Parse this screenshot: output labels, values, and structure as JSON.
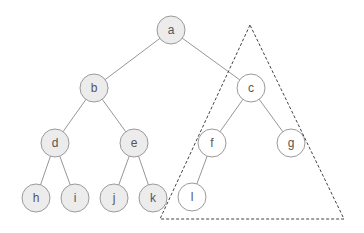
{
  "diagram": {
    "type": "binary-tree",
    "colors": {
      "filled_node": "#ececec",
      "empty_node": "#ffffff",
      "node_stroke": "#9a9a9a",
      "edge": "#8a8a8a",
      "label": "#555555",
      "outline": "#444444"
    },
    "node_radius": 14,
    "nodes": [
      {
        "id": "a",
        "label": "a",
        "x": 171,
        "y": 30,
        "filled": true
      },
      {
        "id": "b",
        "label": "b",
        "x": 94,
        "y": 88,
        "filled": true
      },
      {
        "id": "c",
        "label": "c",
        "x": 251,
        "y": 88,
        "filled": false
      },
      {
        "id": "d",
        "label": "d",
        "x": 55,
        "y": 143,
        "filled": true
      },
      {
        "id": "e",
        "label": "e",
        "x": 134,
        "y": 143,
        "filled": true
      },
      {
        "id": "f",
        "label": "f",
        "x": 212,
        "y": 143,
        "filled": false
      },
      {
        "id": "g",
        "label": "g",
        "x": 291,
        "y": 143,
        "filled": false
      },
      {
        "id": "h",
        "label": "h",
        "x": 36,
        "y": 198,
        "filled": true
      },
      {
        "id": "i",
        "label": "i",
        "x": 75,
        "y": 198,
        "filled": true
      },
      {
        "id": "j",
        "label": "j",
        "x": 114,
        "y": 198,
        "filled": true
      },
      {
        "id": "k",
        "label": "k",
        "x": 153,
        "y": 198,
        "filled": true
      },
      {
        "id": "l",
        "label": "l",
        "x": 192,
        "y": 197,
        "filled": false
      }
    ],
    "edges": [
      [
        "a",
        "b"
      ],
      [
        "a",
        "c"
      ],
      [
        "b",
        "d"
      ],
      [
        "b",
        "e"
      ],
      [
        "c",
        "f"
      ],
      [
        "c",
        "g"
      ],
      [
        "d",
        "h"
      ],
      [
        "d",
        "i"
      ],
      [
        "e",
        "j"
      ],
      [
        "e",
        "k"
      ],
      [
        "f",
        "l"
      ]
    ],
    "subtree_outline": {
      "shape": "dashed-triangle",
      "encloses": [
        "c",
        "f",
        "g",
        "l"
      ],
      "points": [
        [
          250,
          25
        ],
        [
          160,
          219
        ],
        [
          344,
          219
        ]
      ]
    }
  }
}
